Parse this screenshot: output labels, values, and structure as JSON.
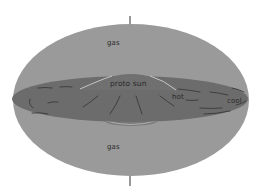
{
  "diagram": {
    "title": "",
    "labels": {
      "gas_top": "gas",
      "gas_bottom": "gas",
      "proto_sun": "proto sun",
      "hot": "hot",
      "cool": "cool"
    },
    "colors": {
      "background": "#ffffff",
      "gas_cloud": "#9a9a9a",
      "disk": "#6e6e6e",
      "disk_dark": "#5a5a5a",
      "streaks": "#3a3a3a",
      "highlight": "#c8c8c8",
      "axis": "#333333",
      "text": "#2a2a2a"
    },
    "elements": [
      {
        "name": "gas-cloud",
        "shape": "ellipse"
      },
      {
        "name": "accretion-disk",
        "shape": "flattened ellipse"
      },
      {
        "name": "proto-sun-bulge",
        "shape": "dome"
      },
      {
        "name": "rotation-axis",
        "shape": "vertical line"
      }
    ]
  }
}
